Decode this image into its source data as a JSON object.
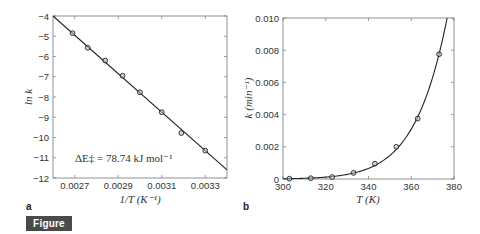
{
  "figure": {
    "caption_label": "Figure 6.3",
    "badge_color": "#4a4a4a"
  },
  "panels": {
    "a": {
      "label": "a",
      "xlabel": "1/T (K⁻¹)",
      "ylabel": "ln k",
      "annotation": "ΔE‡ = 78.74 kJ mol⁻¹",
      "xticks": [
        "0.0027",
        "0.0029",
        "0.0031",
        "0.0033"
      ],
      "yticks": [
        "-4",
        "-5",
        "-6",
        "-7",
        "-8",
        "-9",
        "-10",
        "-11",
        "-12"
      ]
    },
    "b": {
      "label": "b",
      "xlabel": "T (K)",
      "ylabel": "k (min⁻¹)",
      "xticks": [
        "300",
        "320",
        "340",
        "360",
        "380"
      ],
      "yticks": [
        "0",
        "0.002",
        "0.004",
        "0.006",
        "0.008",
        "0.010"
      ]
    }
  },
  "chart_data": [
    {
      "type": "scatter",
      "panel": "a",
      "title": "",
      "xlabel": "1/T (K^-1)",
      "ylabel": "ln k",
      "xlim": [
        0.0026,
        0.0034
      ],
      "ylim": [
        -12,
        -4
      ],
      "grid": false,
      "series": [
        {
          "name": "data",
          "marker": "circle",
          "x": [
            0.00269,
            0.00276,
            0.00284,
            0.00292,
            0.003,
            0.0031,
            0.00319,
            0.0033
          ],
          "y": [
            -4.85,
            -5.57,
            -6.2,
            -6.95,
            -7.77,
            -8.75,
            -9.78,
            -10.65
          ]
        },
        {
          "name": "linear fit",
          "style": "line",
          "x": [
            0.0026,
            0.0034
          ],
          "y": [
            -4.0,
            -11.6
          ]
        }
      ],
      "annotations": [
        "ΔE‡ = 78.74 kJ mol^-1"
      ]
    },
    {
      "type": "scatter",
      "panel": "b",
      "title": "",
      "xlabel": "T (K)",
      "ylabel": "k (min^-1)",
      "xlim": [
        300,
        380
      ],
      "ylim": [
        0,
        0.01
      ],
      "grid": false,
      "series": [
        {
          "name": "data",
          "marker": "circle",
          "x": [
            303,
            313,
            323,
            333,
            343,
            353,
            363,
            373
          ],
          "y": [
            2e-05,
            5e-05,
            0.00012,
            0.00038,
            0.00095,
            0.002,
            0.00375,
            0.00775
          ]
        },
        {
          "name": "Arrhenius fit",
          "style": "line"
        }
      ]
    }
  ]
}
